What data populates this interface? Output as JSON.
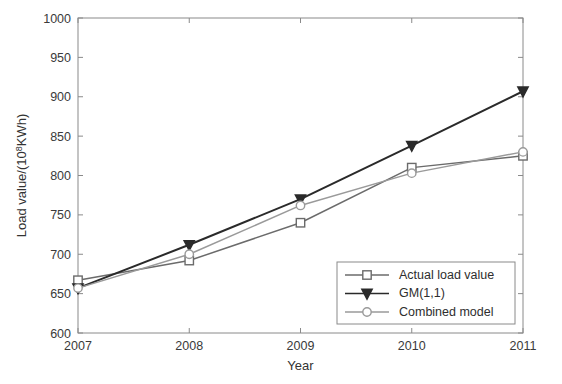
{
  "chart_data": {
    "type": "line",
    "title": "",
    "xlabel": "Year",
    "ylabel_prefix": "Load value/(10",
    "ylabel_exponent": "8",
    "ylabel_suffix": "KWh)",
    "ylabel_full": "Load value/(10^8KWh)",
    "x": [
      2007,
      2008,
      2009,
      2010,
      2011
    ],
    "xticklabels": [
      "2007",
      "2008",
      "2009",
      "2010",
      "2011"
    ],
    "yticklabels": [
      "600",
      "650",
      "700",
      "750",
      "800",
      "850",
      "900",
      "950",
      "1000"
    ],
    "yticks": [
      600,
      650,
      700,
      750,
      800,
      850,
      900,
      950,
      1000
    ],
    "xlim": [
      2007,
      2011
    ],
    "ylim": [
      600,
      1000
    ],
    "grid": false,
    "legend_position": "lower-right-inside",
    "series": [
      {
        "name": "Actual load value",
        "marker": "square",
        "color": "#6b6b6b",
        "values": [
          667,
          692,
          740,
          810,
          825
        ]
      },
      {
        "name": "GM(1,1)",
        "marker": "triangle-down",
        "color": "#2a2a2a",
        "values": [
          657,
          712,
          770,
          838,
          907
        ]
      },
      {
        "name": "Combined model",
        "marker": "circle",
        "color": "#9a9a9a",
        "values": [
          657,
          700,
          762,
          803,
          830
        ]
      }
    ]
  },
  "legend": {
    "items": [
      {
        "label": "Actual load value"
      },
      {
        "label": "GM(1,1)"
      },
      {
        "label": "Combined model"
      }
    ]
  },
  "axes": {
    "x_title": "Year",
    "y_title": "Load value/(10^8KWh)"
  }
}
